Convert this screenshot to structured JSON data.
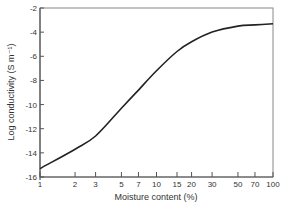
{
  "chart_data": {
    "type": "line",
    "title": "",
    "xlabel": "Moisture content (%)",
    "ylabel": "Log conductivity (S m⁻¹)",
    "x_scale": "log",
    "xlim": [
      1,
      100
    ],
    "ylim": [
      -16,
      -2
    ],
    "grid": false,
    "legend": null,
    "x_ticks": [
      1,
      2,
      3,
      5,
      7,
      10,
      15,
      20,
      30,
      50,
      70,
      100
    ],
    "x_tick_labels": [
      "1",
      "2",
      "3",
      "5",
      "7",
      "10",
      "15",
      "20",
      "30",
      "50",
      "70",
      "100"
    ],
    "y_ticks": [
      -2,
      -4,
      -6,
      -8,
      -10,
      -12,
      -14,
      -16
    ],
    "y_tick_labels": [
      "-2",
      "-4",
      "-6",
      "-8",
      "-10",
      "-12",
      "-14",
      "-16"
    ],
    "series": [
      {
        "name": "Log conductivity",
        "x": [
          1,
          2,
          3,
          5,
          7,
          10,
          15,
          20,
          30,
          50,
          70,
          100
        ],
        "values": [
          -15.3,
          -13.7,
          -12.6,
          -10.3,
          -8.8,
          -7.2,
          -5.6,
          -4.8,
          -4.0,
          -3.5,
          -3.4,
          -3.3
        ]
      }
    ]
  },
  "colors": {
    "line": "#222222",
    "axis": "#555555",
    "frame": "#888888"
  }
}
